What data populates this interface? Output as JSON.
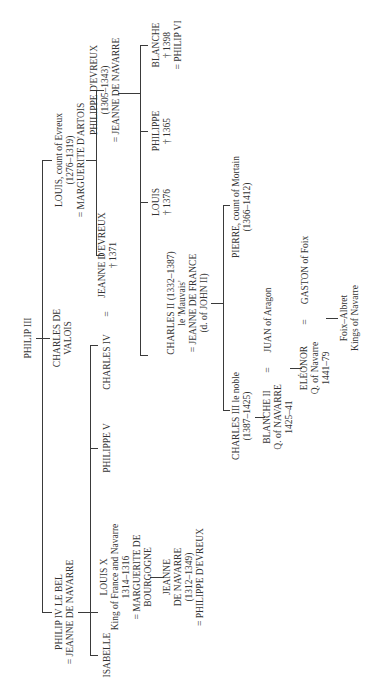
{
  "nodes": {
    "philip3": {
      "lines": [
        "PHILIP III"
      ]
    },
    "philip4": {
      "lines": [
        "PHILIP IV LE BEL",
        "= JEANNE DE NAVARRE"
      ]
    },
    "charles_valois": {
      "lines": [
        "CHARLES DE",
        "VALOIS"
      ]
    },
    "louis_evreux": {
      "lines": [
        "LOUIS, count of Evreux",
        "(1276–1319)",
        "= MARGUERITE D'ARTOIS"
      ]
    },
    "isabelle": {
      "lines": [
        "ISABELLE"
      ]
    },
    "louis10": {
      "lines": [
        "LOUIS X",
        "King of France and Navarre",
        "1314–1316",
        "= MARGUERITE DE",
        "BOURGOGNE"
      ]
    },
    "philippe5": {
      "lines": [
        "PHILIPPE V"
      ]
    },
    "charles4": {
      "lines": [
        "CHARLES IV"
      ]
    },
    "eq_charles4": {
      "lines": [
        "="
      ]
    },
    "jeanne_evreux": {
      "lines": [
        "JEANNE D'EVREUX",
        "† 1371"
      ]
    },
    "philippe_evreux": {
      "lines": [
        "PHILIPPE D'EVREUX",
        "(1305–1343)",
        "= JEANNE DE NAVARRE"
      ]
    },
    "jeanne_navarre": {
      "lines": [
        "JEANNE",
        "DE NAVARRE",
        "(1312–1349)",
        "= PHILIPPE D'EVREUX"
      ]
    },
    "charles2": {
      "lines": [
        "CHARLES II (1332–1387)",
        "le 'Mauvais'",
        "= JEANNE DE FRANCE",
        "(d. of JOHN II)"
      ]
    },
    "louis_1376": {
      "lines": [
        "LOUIS",
        "† 1376"
      ]
    },
    "philippe_1365": {
      "lines": [
        "PHILIPPE",
        "† 1365"
      ]
    },
    "blanche_1398": {
      "lines": [
        "BLANCHE",
        "† 1398",
        "= PHILIP VI"
      ]
    },
    "charles3": {
      "lines": [
        "CHARLES III le noble",
        "(1387–1425)"
      ]
    },
    "pierre": {
      "lines": [
        "PIERRE, count of Mortain",
        "(1366–1412)"
      ]
    },
    "blanche2": {
      "lines": [
        "BLANCHE II",
        "Q. of NAVARRE",
        "1425–41"
      ]
    },
    "eq_blanche2": {
      "lines": [
        "="
      ]
    },
    "juan": {
      "lines": [
        "JUAN of Aragon"
      ]
    },
    "eleonor": {
      "lines": [
        "ELÉONOR",
        "Q. of Navarre",
        "1441–79"
      ]
    },
    "eq_eleonor": {
      "lines": [
        "="
      ]
    },
    "gaston": {
      "lines": [
        "GASTON of Foix"
      ]
    },
    "foix_albret": {
      "lines": [
        "Foix–Albret",
        "Kings of Navarre"
      ]
    }
  }
}
